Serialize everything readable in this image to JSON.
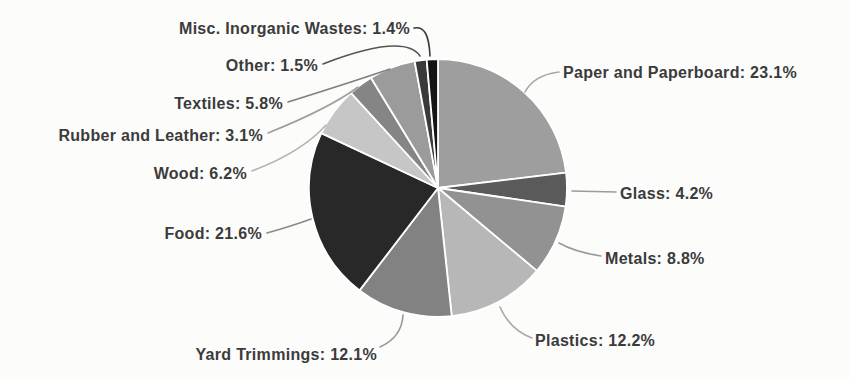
{
  "figure": {
    "background": "#fcfcfb",
    "text_color": "#3b3b3b",
    "separator_color": "#ffffff"
  },
  "chart_data": {
    "type": "pie",
    "title": "",
    "start_angle_deg": 0,
    "direction": "clockwise",
    "label_format": "{label}: {value}%",
    "legend_position": "none",
    "labels_style": "outside-with-leader-lines",
    "slices": [
      {
        "label": "Paper and Paperboard",
        "value": 23.1,
        "color": "#9e9e9e",
        "leader_color": "#a9a9a9"
      },
      {
        "label": "Glass",
        "value": 4.2,
        "color": "#5a5a5a",
        "leader_color": "#9b9b9b"
      },
      {
        "label": "Metals",
        "value": 8.8,
        "color": "#929292",
        "leader_color": "#9b9b9b"
      },
      {
        "label": "Plastics",
        "value": 12.2,
        "color": "#b7b7b7",
        "leader_color": "#aaaaaa"
      },
      {
        "label": "Yard Trimmings",
        "value": 12.1,
        "color": "#828282",
        "leader_color": "#989898"
      },
      {
        "label": "Food",
        "value": 21.6,
        "color": "#282828",
        "leader_color": "#8a8a8a"
      },
      {
        "label": "Wood",
        "value": 6.2,
        "color": "#c6c6c6",
        "leader_color": "#b3b3b3"
      },
      {
        "label": "Rubber and Leather",
        "value": 3.1,
        "color": "#858585",
        "leader_color": "#9e9e9e"
      },
      {
        "label": "Textiles",
        "value": 5.8,
        "color": "#9b9b9b",
        "leader_color": "#7f7f7f"
      },
      {
        "label": "Other",
        "value": 1.5,
        "color": "#3a3a3a",
        "leader_color": "#555555"
      },
      {
        "label": "Misc. Inorganic Wastes",
        "value": 1.4,
        "color": "#141414",
        "leader_color": "#3a3a3a"
      }
    ]
  }
}
